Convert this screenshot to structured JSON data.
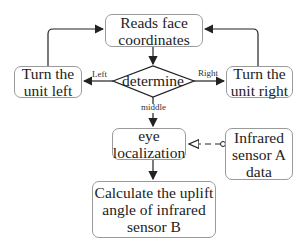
{
  "nodes": {
    "read_face": {
      "line1": "Reads face",
      "line2": "coordinates"
    },
    "turn_left": {
      "line1": "Turn the",
      "line2": "unit left"
    },
    "determine": {
      "label": "determine"
    },
    "turn_right": {
      "line1": "Turn the",
      "line2": "unit right"
    },
    "eye_loc": {
      "line1": "eye",
      "line2": "localization"
    },
    "infrared_a": {
      "line1": "Infrared",
      "line2": "sensor A",
      "line3": "data"
    },
    "calc_angle": {
      "line1": "Calculate the uplift",
      "line2": "angle of infrared",
      "line3": "sensor B"
    }
  },
  "edges": {
    "left_label": "Left",
    "right_label": "Right",
    "middle_label": "middle"
  },
  "colors": {
    "stroke": "#222222",
    "box_border": "#9a9a9a"
  }
}
